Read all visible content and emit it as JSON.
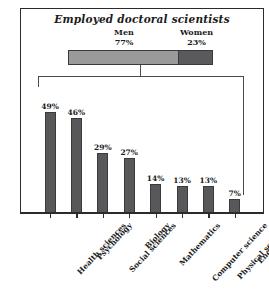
{
  "chart_data": {
    "type": "bar",
    "title": "Employed doctoral scientists",
    "ylabel": "Percentage of women, by field",
    "xlabel": "",
    "ylim": [
      0,
      55
    ],
    "grid": false,
    "legend": "none",
    "categories": [
      "Health sciences",
      "Psychology",
      "Social sciences",
      "Biology",
      "Mathematics",
      "Computer science",
      "Physical sciences",
      "Engineering"
    ],
    "values": [
      49,
      46,
      29,
      27,
      14,
      13,
      13,
      7
    ],
    "value_labels": [
      "49%",
      "46%",
      "29%",
      "27%",
      "14%",
      "13%",
      "13%",
      "7%"
    ],
    "stacked_summary": {
      "segments": [
        {
          "name": "Men",
          "percent": 77,
          "label": "77%",
          "color": "#9a9a9a"
        },
        {
          "name": "Women",
          "percent": 23,
          "label": "23%",
          "color": "#5a5a5c"
        }
      ]
    },
    "colors": {
      "bar": "#58585a",
      "axis": "#2b2b2b",
      "frame": "#2b2b2b",
      "background": "#ffffff"
    }
  }
}
